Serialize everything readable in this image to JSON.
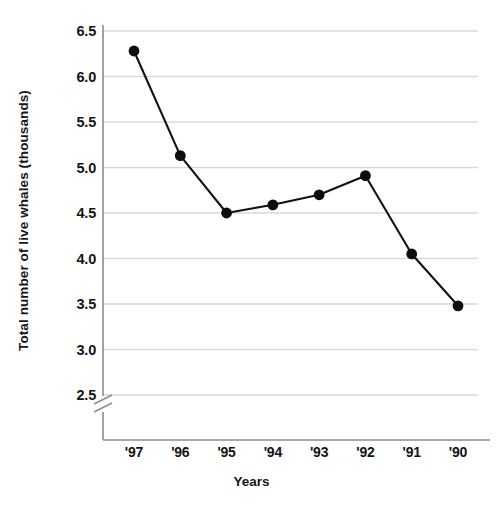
{
  "chart_data": {
    "type": "line",
    "title": "",
    "xlabel": "Years",
    "ylabel": "Total number of live whales (thousands)",
    "categories": [
      "'97",
      "'96",
      "'95",
      "'94",
      "'93",
      "'92",
      "'91",
      "'90"
    ],
    "values": [
      6.28,
      5.13,
      4.5,
      4.59,
      4.7,
      4.91,
      4.05,
      3.48
    ],
    "series": [
      {
        "name": "Total number of live whales (thousands)",
        "values": [
          6.28,
          5.13,
          4.5,
          4.59,
          4.7,
          4.91,
          4.05,
          3.48
        ]
      }
    ],
    "ylim": [
      2.5,
      6.5
    ],
    "ytick_labels": [
      "6.5",
      "6.0",
      "5.5",
      "5.0",
      "4.5",
      "4.0",
      "3.5",
      "3.0",
      "2.5"
    ],
    "ytick_values": [
      6.5,
      6.0,
      5.5,
      5.0,
      4.5,
      4.0,
      3.5,
      3.0,
      2.5
    ],
    "grid": true,
    "legend": "none",
    "axis_break": true,
    "marker": "filled-circle",
    "colors": {
      "line": "#111111",
      "marker": "#0d0d0d",
      "grid": "#d9d9d9",
      "axis": "#8c8c8c",
      "text": "#141414",
      "background": "#ffffff"
    }
  }
}
